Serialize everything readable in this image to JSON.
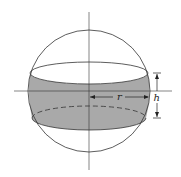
{
  "diagram": {
    "labels": {
      "radius": "r",
      "height": "h"
    },
    "colors": {
      "stroke": "#333333",
      "band_fill": "#a9a9a9",
      "background": "#ffffff"
    },
    "geometry": {
      "sphere": {
        "cx": 89,
        "cy": 91,
        "r": 61
      },
      "upper_ellipse": {
        "cx": 89,
        "cy": 73,
        "rx": 59,
        "ry": 11
      },
      "lower_ellipse": {
        "cx": 89,
        "cy": 118,
        "rx": 57,
        "ry": 12
      }
    }
  }
}
